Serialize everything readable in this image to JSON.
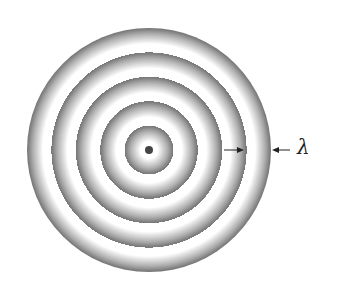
{
  "figure": {
    "center": {
      "x": 149,
      "y": 150
    },
    "source_dot_radius": 4,
    "wavefront_count": 5,
    "wavelength_px": 24.5,
    "outer_radius_px": 122,
    "colors": {
      "background": "#ffffff",
      "crest_dark": "#7a7a7a",
      "crest_mid": "#b0b0b0",
      "trough_light": "#ffffff",
      "source_dot": "#444444",
      "arrow": "#222222"
    }
  },
  "annotation": {
    "label": "λ",
    "meaning": "wavelength",
    "arrow_left": {
      "from_x": 224,
      "to_x": 244,
      "y": 150
    },
    "arrow_right": {
      "from_x": 290,
      "to_x": 272,
      "y": 150
    }
  }
}
